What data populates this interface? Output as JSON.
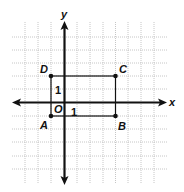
{
  "diagram": {
    "type": "coordinate-plane",
    "axes": {
      "x_label": "x",
      "y_label": "y",
      "origin_label": "O"
    },
    "unit_labels": {
      "x_unit": "1",
      "y_unit": "1"
    },
    "grid": {
      "x_range": [
        -3,
        7
      ],
      "y_range": [
        -5,
        5
      ]
    },
    "rectangle": {
      "vertices": [
        {
          "name": "A",
          "x": -1,
          "y": -1
        },
        {
          "name": "B",
          "x": 4,
          "y": -1
        },
        {
          "name": "C",
          "x": 4,
          "y": 2
        },
        {
          "name": "D",
          "x": -1,
          "y": 2
        }
      ]
    },
    "colors": {
      "axis": "#111111",
      "grid": "#b8b8b8",
      "rectangle": "#111111"
    }
  }
}
